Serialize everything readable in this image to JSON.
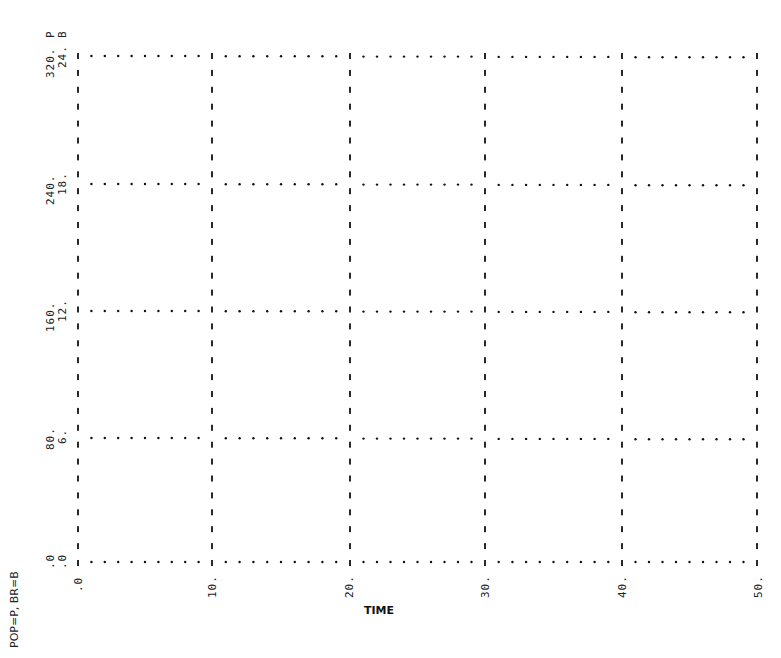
{
  "chart_data": {
    "type": "line",
    "title": "",
    "xlabel": "TIME",
    "ylabel": "POP=P, BR=B",
    "legend": "POP=P, BR=B",
    "x_ticks": [
      "0",
      "10.",
      "20.",
      "30.",
      "40.",
      "50."
    ],
    "x_range": [
      0,
      50
    ],
    "y_axes": [
      {
        "name": "POP",
        "symbol": "P",
        "ticks": [
          ".0",
          "80.",
          "160.",
          "240.",
          "320."
        ],
        "range": [
          0,
          320
        ]
      },
      {
        "name": "BR",
        "symbol": "B",
        "ticks": [
          ".0",
          "6.",
          "12.",
          "18.",
          "24."
        ],
        "range": [
          0,
          24
        ]
      }
    ],
    "grid": true,
    "series": [
      {
        "name": "POP",
        "symbol": "P",
        "values": []
      },
      {
        "name": "BR",
        "symbol": "B",
        "values": []
      }
    ]
  },
  "labels": {
    "legend": "POP=P, BR=B",
    "xtitle": "TIME",
    "top_p": "P",
    "top_b": "B",
    "pop_ticks": [
      ".0",
      "80.",
      "160.",
      "240.",
      "320."
    ],
    "br_ticks": [
      ".0",
      "6.",
      "12.",
      "18.",
      "24."
    ],
    "x_ticks": [
      ".0",
      "10.",
      "20.",
      "30.",
      "40.",
      "50."
    ]
  }
}
